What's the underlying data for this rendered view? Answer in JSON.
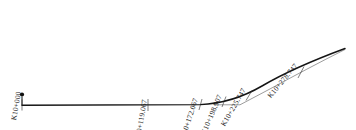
{
  "drawing": {
    "title": "Road alignment station diagram",
    "background_color": "#ffffff",
    "line_color": "#141414",
    "tangent_color": "#4a4a4a",
    "text_color": "#1a1a1a"
  },
  "stations": [
    {
      "id": "station-0",
      "label": "K10+000",
      "tick_x": 22,
      "tick_y": 105,
      "rotation": -80,
      "has_marker": true,
      "text_x": 21,
      "text_y": 92
    },
    {
      "id": "station-1",
      "label": "K10+119.067",
      "tick_x": 148,
      "tick_y": 105,
      "rotation": -80,
      "has_marker": false,
      "text_x": 147,
      "text_y": 100
    },
    {
      "id": "station-2",
      "label": "K10+172.067",
      "tick_x": 200,
      "tick_y": 103,
      "rotation": -72,
      "has_marker": false,
      "text_x": 198,
      "text_y": 99
    },
    {
      "id": "station-3",
      "label": "K10+198.907",
      "tick_x": 224,
      "tick_y": 101,
      "rotation": -67,
      "has_marker": false,
      "text_x": 222,
      "text_y": 97
    },
    {
      "id": "station-4",
      "label": "K10+225.747",
      "tick_x": 249,
      "tick_y": 96,
      "rotation": -60,
      "has_marker": false,
      "text_x": 247,
      "text_y": 92
    },
    {
      "id": "station-5",
      "label": "K10+278.747",
      "tick_x": 301,
      "tick_y": 73,
      "rotation": -50,
      "has_marker": false,
      "text_x": 299,
      "text_y": 69
    }
  ],
  "geometry": {
    "main_path": "M 22 105.2 L 200 104.6 C 224 103.6 244 96.5 262 86.0 C 285 72.5 318 58.5 345 48.5",
    "tangent_path": "M 215 104.8 L 240 104.8 L 268 90.0 C 292 77.0 320 62.0 345 49.5",
    "start_riser": {
      "x": 22,
      "y1": 96.5,
      "y2": 105.2
    },
    "start_marker": {
      "cx": 22,
      "cy": 94.5,
      "r": 2.1
    }
  }
}
